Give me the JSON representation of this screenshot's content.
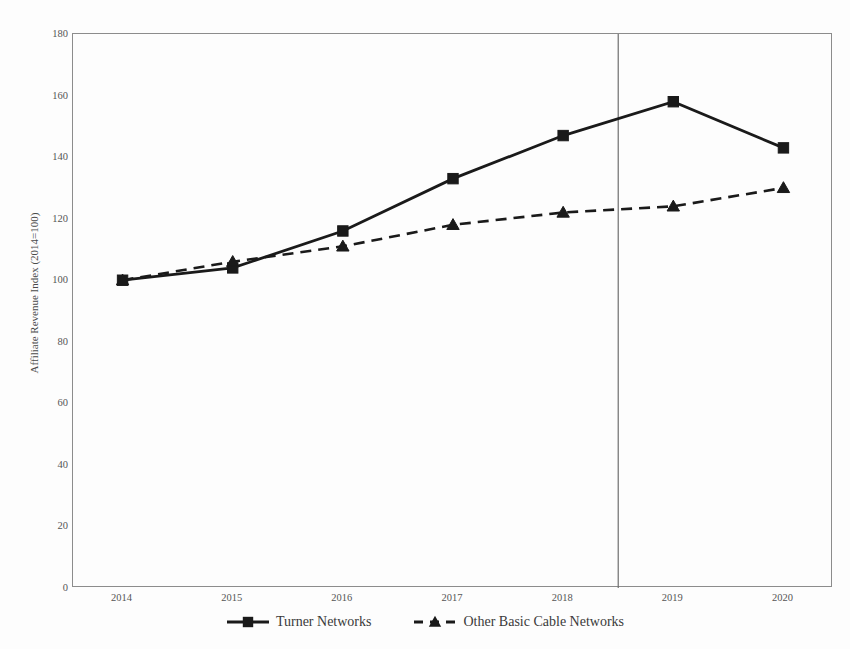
{
  "chart_data": {
    "type": "line",
    "title": "",
    "title_clipped_note": "title is cut off at top edge of screenshot",
    "xlabel": "",
    "ylabel": "Affiliate Revenue Index (2014=100)",
    "categories": [
      "2014",
      "2015",
      "2016",
      "2017",
      "2018",
      "2019",
      "2020"
    ],
    "x": [
      2014,
      2015,
      2016,
      2017,
      2018,
      2019,
      2020
    ],
    "xlim": [
      2013.55,
      2020.45
    ],
    "ylim": [
      0,
      180
    ],
    "yticks": [
      0,
      20,
      40,
      60,
      80,
      100,
      120,
      140,
      160,
      180
    ],
    "ytick_labels": [
      "0",
      "20",
      "40",
      "60",
      "80",
      "100",
      "120",
      "140",
      "160",
      "180"
    ],
    "grid": false,
    "legend_position": "bottom",
    "series": [
      {
        "name": "Turner Networks",
        "values": [
          100,
          104,
          116,
          133,
          147,
          158,
          143
        ],
        "line_style": "solid",
        "marker": "square",
        "color": "#1a1a1a"
      },
      {
        "name": "Other Basic Cable Networks",
        "values": [
          100,
          106,
          111,
          118,
          122,
          124,
          130
        ],
        "line_style": "dashed",
        "marker": "triangle",
        "color": "#1a1a1a"
      }
    ],
    "annotations": [
      {
        "type": "vertical-line",
        "name": "merger-divider-line",
        "x": 2018.5,
        "label": ""
      }
    ],
    "colors": {
      "axis": "#8c8c8c",
      "series": "#1a1a1a",
      "divider": "#6e6e6e",
      "text": "#4a4a4a",
      "background": "#fdfdfd"
    }
  }
}
